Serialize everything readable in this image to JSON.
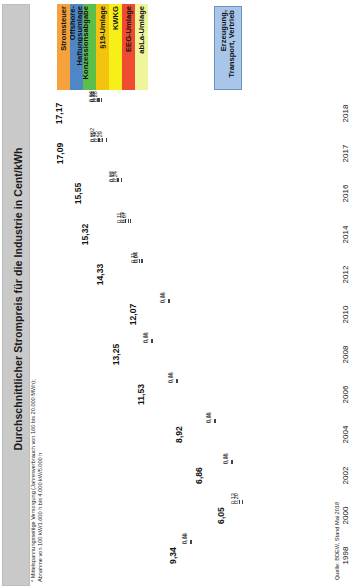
{
  "title": "Durchschnittlicher Strompreis für die Industrie in Cent/kWh",
  "footnote": {
    "line1": "*  Mittelspannungsseitige Versorgung (Jahresverbrauch von 160 bis 20.000 MWh);",
    "line2": "   Abnahme von 100 kW/1.600 h bis 4.000 kW/5.000 h"
  },
  "source": "Quelle: BDEW, Stand Mai 2018",
  "legend": {
    "items": [
      {
        "label": "Stromsteuer",
        "color": "#F6A23C",
        "name": "stromsteuer"
      },
      {
        "label": "Offshore-Haftungsumlage",
        "color": "#4E86C6",
        "name": "offshore-haftungsumlage"
      },
      {
        "label": "Konzessionsabgabe",
        "color": "#5BBF4A",
        "name": "konzessionsabgabe"
      },
      {
        "label": "§19-Umlage",
        "color": "#F2C40F",
        "name": "paragraph19-umlage"
      },
      {
        "label": "KWKG",
        "color": "#F7F018",
        "name": "kwkg"
      },
      {
        "label": "EEG-Umlage",
        "color": "#EE4B32",
        "name": "eeg-umlage"
      },
      {
        "label": "abLa-Umlage",
        "color": "#EFF59A",
        "name": "abla-umlage"
      }
    ],
    "right": {
      "label": "Erzeugung, Transport, Vertrieb",
      "color": "#A8C6EA",
      "name": "erzeugung-transport-vertrieb"
    }
  },
  "chart_data": {
    "type": "bar",
    "orientation": "horizontal-stacked",
    "title": "Durchschnittlicher Strompreis für die Industrie in Cent/kWh",
    "xlabel": "",
    "ylabel": "Cent/kWh",
    "xlim": [
      0,
      18
    ],
    "grid": false,
    "legend_position": "top",
    "categories": [
      "2018",
      "2017",
      "2016",
      "2014",
      "2012",
      "2010",
      "2008",
      "2006",
      "2004",
      "2002",
      "2000",
      "1998"
    ],
    "totals": [
      "17,17",
      "17,09",
      "15,55",
      "15,32",
      "14,33",
      "12,07",
      "13,25",
      "11,53",
      "8,92",
      "6,86",
      "6,05",
      "9,34"
    ],
    "series": [
      {
        "name": "Stromsteuer",
        "color": "#F6A23C",
        "values": [
          1.537,
          1.54,
          1.54,
          1.54,
          1.54,
          1.23,
          1.23,
          1.23,
          1.23,
          1.03,
          0.26,
          0.0
        ]
      },
      {
        "name": "Offshore-Haftungsumlage",
        "color": "#4E86C6",
        "values": [
          0.037,
          0.002,
          0.04,
          0.25,
          0.0,
          0.0,
          0.0,
          0.0,
          0.0,
          0.0,
          0.0,
          0.0
        ]
      },
      {
        "name": "Konzessionsabgabe",
        "color": "#5BBF4A",
        "values": [
          0.04,
          0.11,
          0.03,
          0.11,
          0.11,
          0.11,
          0.11,
          0.11,
          0.11,
          0.11,
          0.13,
          0.11
        ]
      },
      {
        "name": "§19-Umlage",
        "color": "#F2C40F",
        "values": [
          0.11,
          0.25,
          0.38,
          0.23,
          0.1,
          0.0,
          0.0,
          0.0,
          0.0,
          0.0,
          0.0,
          0.0
        ]
      },
      {
        "name": "KWKG",
        "color": "#F7F018",
        "values": [
          0.24,
          0.29,
          0.44,
          0.07,
          0.05,
          0.05,
          0.05,
          0.05,
          0.05,
          0.05,
          0.2,
          0.08
        ]
      },
      {
        "name": "EEG-Umlage",
        "color": "#EE4B32",
        "values": [
          6.792,
          6.88,
          6.354,
          6.24,
          3.59,
          2.05,
          1.16,
          0.88,
          0.51,
          0.35,
          0.0,
          0.0
        ]
      },
      {
        "name": "abLa-Umlage",
        "color": "#EFF59A",
        "values": [
          0.26,
          0.0,
          0.0,
          0.0,
          0.0,
          0.0,
          0.0,
          0.0,
          0.0,
          0.0,
          0.0,
          0.0
        ]
      },
      {
        "name": "Erzeugung, Transport, Vertrieb",
        "color": "#A8C6EA",
        "values": [
          8.18,
          8.02,
          7.0,
          6.95,
          8.98,
          8.63,
          10.7,
          9.26,
          7.02,
          5.99,
          5.46,
          9.15
        ]
      }
    ],
    "rows": [
      {
        "year": "2018",
        "total": "17,17",
        "segments": [
          {
            "name": "Stromsteuer",
            "value": 1.537,
            "label": "1,537",
            "color": "#F6A23C",
            "inside": true
          },
          {
            "name": "Offshore-Haftungsumlage",
            "value": 0.037,
            "label": "",
            "color": "#4E86C6",
            "inside": false
          },
          {
            "name": "Konzessionsabgabe",
            "value": 0.04,
            "label": "",
            "color": "#5BBF4A",
            "inside": false
          },
          {
            "name": "§19-Umlage",
            "value": 0.11,
            "label": "",
            "color": "#F2C40F",
            "inside": false
          },
          {
            "name": "KWKG",
            "value": 0.24,
            "label": "",
            "color": "#F7F018",
            "inside": false
          },
          {
            "name": "abLa-Umlage",
            "value": 0.26,
            "label": "",
            "color": "#EFF59A",
            "inside": false
          },
          {
            "name": "EEG-Umlage",
            "value": 6.792,
            "label": "6,792",
            "color": "#EE4B32",
            "inside": true
          },
          {
            "name": "Erzeugung, Transport, Vertrieb",
            "value": 8.18,
            "label": "8,18",
            "color": "#A8C6EA",
            "inside": true
          }
        ],
        "callouts": [
          "0,04",
          "0,11",
          "0,24",
          "0,26"
        ]
      },
      {
        "year": "2017",
        "total": "17,09",
        "segments": [
          {
            "name": "Stromsteuer",
            "value": 1.54,
            "label": "1,54",
            "color": "#F6A23C",
            "inside": true
          },
          {
            "name": "Offshore-Haftungsumlage",
            "value": 0.002,
            "label": "",
            "color": "#4E86C6",
            "inside": false
          },
          {
            "name": "Konzessionsabgabe",
            "value": 0.11,
            "label": "",
            "color": "#5BBF4A",
            "inside": false
          },
          {
            "name": "§19-Umlage",
            "value": 0.25,
            "label": "",
            "color": "#F2C40F",
            "inside": false
          },
          {
            "name": "KWKG",
            "value": 0.29,
            "label": "",
            "color": "#F7F018",
            "inside": false
          },
          {
            "name": "EEG-Umlage",
            "value": 6.88,
            "label": "6,88",
            "color": "#EE4B32",
            "inside": true
          },
          {
            "name": "Erzeugung, Transport, Vertrieb",
            "value": 8.02,
            "label": "8,02",
            "color": "#A8C6EA",
            "inside": true
          }
        ],
        "callouts": [
          "0,002",
          "0,11",
          "0,25",
          "0,29"
        ]
      },
      {
        "year": "2016",
        "total": "15,55",
        "segments": [
          {
            "name": "Stromsteuer",
            "value": 1.54,
            "label": "1,54",
            "color": "#F6A23C",
            "inside": true
          },
          {
            "name": "Offshore-Haftungsumlage",
            "value": 0.03,
            "label": "0,03",
            "color": "#4E86C6",
            "inside": false
          },
          {
            "name": "Konzessionsabgabe",
            "value": 0.11,
            "label": "",
            "color": "#5BBF4A",
            "inside": false
          },
          {
            "name": "§19-Umlage",
            "value": 0.38,
            "label": "",
            "color": "#F2C40F",
            "inside": false
          },
          {
            "name": "KWKG",
            "value": 0.44,
            "label": "",
            "color": "#F7F018",
            "inside": false
          },
          {
            "name": "EEG-Umlage",
            "value": 6.354,
            "label": "6,354",
            "color": "#EE4B32",
            "inside": true
          },
          {
            "name": "Erzeugung, Transport, Vertrieb",
            "value": 7.0,
            "label": "7,00",
            "color": "#A8C6EA",
            "inside": true
          }
        ],
        "callouts": [
          "0,03",
          "0,11",
          "0,24"
        ]
      },
      {
        "year": "2014",
        "total": "15,32",
        "segments": [
          {
            "name": "Stromsteuer",
            "value": 1.54,
            "label": "1,54",
            "color": "#F6A23C",
            "inside": true
          },
          {
            "name": "Offshore-Haftungsumlage",
            "value": 0.25,
            "label": "0,25",
            "color": "#4E86C6",
            "inside": true
          },
          {
            "name": "Konzessionsabgabe",
            "value": 0.11,
            "label": "",
            "color": "#5BBF4A",
            "inside": false
          },
          {
            "name": "§19-Umlage",
            "value": 0.23,
            "label": "",
            "color": "#F2C40F",
            "inside": false
          },
          {
            "name": "KWKG",
            "value": 0.07,
            "label": "",
            "color": "#F7F018",
            "inside": false
          },
          {
            "name": "EEG-Umlage",
            "value": 6.24,
            "label": "6,24",
            "color": "#EE4B32",
            "inside": true
          },
          {
            "name": "Erzeugung, Transport, Vertrieb",
            "value": 6.95,
            "label": "6,95",
            "color": "#A8C6EA",
            "inside": true
          }
        ],
        "callouts": [
          "0,11",
          "0,23",
          "0,07"
        ]
      },
      {
        "year": "2012",
        "total": "14,33",
        "segments": [
          {
            "name": "Stromsteuer",
            "value": 1.54,
            "label": "1,54",
            "color": "#F6A23C",
            "inside": true
          },
          {
            "name": "Konzessionsabgabe",
            "value": 0.11,
            "label": "",
            "color": "#5BBF4A",
            "inside": false
          },
          {
            "name": "§19-Umlage",
            "value": 0.07,
            "label": "",
            "color": "#F2C40F",
            "inside": false
          },
          {
            "name": "KWKG",
            "value": 0.04,
            "label": "",
            "color": "#F7F018",
            "inside": false
          },
          {
            "name": "EEG-Umlage",
            "value": 3.59,
            "label": "3,59",
            "color": "#EE4B32",
            "inside": true
          },
          {
            "name": "Erzeugung, Transport, Vertrieb",
            "value": 8.98,
            "label": "8,98",
            "color": "#A8C6EA",
            "inside": true
          }
        ],
        "callouts": [
          "0,11",
          "0,07",
          "0,04"
        ]
      },
      {
        "year": "2010",
        "total": "12,07",
        "segments": [
          {
            "name": "Stromsteuer",
            "value": 1.23,
            "label": "1,23",
            "color": "#F6A23C",
            "inside": true
          },
          {
            "name": "Konzessionsabgabe",
            "value": 0.11,
            "label": "",
            "color": "#5BBF4A",
            "inside": false
          },
          {
            "name": "KWKG",
            "value": 0.05,
            "label": "",
            "color": "#F7F018",
            "inside": false
          },
          {
            "name": "EEG-Umlage",
            "value": 2.05,
            "label": "2,05",
            "color": "#EE4B32",
            "inside": true
          },
          {
            "name": "Erzeugung, Transport, Vertrieb",
            "value": 8.63,
            "label": "8,63",
            "color": "#A8C6EA",
            "inside": true
          }
        ],
        "callouts": [
          "0,11",
          "0,05"
        ]
      },
      {
        "year": "2008",
        "total": "13,25",
        "segments": [
          {
            "name": "Stromsteuer",
            "value": 1.23,
            "label": "1,23",
            "color": "#F6A23C",
            "inside": true
          },
          {
            "name": "Konzessionsabgabe",
            "value": 0.11,
            "label": "",
            "color": "#5BBF4A",
            "inside": false
          },
          {
            "name": "KWKG",
            "value": 0.05,
            "label": "",
            "color": "#F7F018",
            "inside": false
          },
          {
            "name": "EEG-Umlage",
            "value": 1.16,
            "label": "1,16",
            "color": "#EE4B32",
            "inside": true
          },
          {
            "name": "Erzeugung, Transport, Vertrieb",
            "value": 10.7,
            "label": "10,70",
            "color": "#A8C6EA",
            "inside": true
          }
        ],
        "callouts": [
          "0,11",
          "0,05"
        ]
      },
      {
        "year": "2006",
        "total": "11,53",
        "segments": [
          {
            "name": "Stromsteuer",
            "value": 1.23,
            "label": "1,23",
            "color": "#F6A23C",
            "inside": true
          },
          {
            "name": "Konzessionsabgabe",
            "value": 0.11,
            "label": "",
            "color": "#5BBF4A",
            "inside": false
          },
          {
            "name": "KWKG",
            "value": 0.05,
            "label": "",
            "color": "#F7F018",
            "inside": false
          },
          {
            "name": "EEG-Umlage",
            "value": 0.88,
            "label": "0,88",
            "color": "#EE4B32",
            "inside": true
          },
          {
            "name": "Erzeugung, Transport, Vertrieb",
            "value": 9.26,
            "label": "9,26",
            "color": "#A8C6EA",
            "inside": true
          }
        ],
        "callouts": [
          "0,11",
          "0,05"
        ]
      },
      {
        "year": "2004",
        "total": "8,92",
        "segments": [
          {
            "name": "Stromsteuer",
            "value": 1.23,
            "label": "1,23",
            "color": "#F6A23C",
            "inside": true
          },
          {
            "name": "Konzessionsabgabe",
            "value": 0.11,
            "label": "",
            "color": "#5BBF4A",
            "inside": false
          },
          {
            "name": "KWKG",
            "value": 0.05,
            "label": "",
            "color": "#F7F018",
            "inside": false
          },
          {
            "name": "EEG-Umlage",
            "value": 0.51,
            "label": "0,51",
            "color": "#EE4B32",
            "inside": true
          },
          {
            "name": "Erzeugung, Transport, Vertrieb",
            "value": 7.02,
            "label": "7,02",
            "color": "#A8C6EA",
            "inside": true
          }
        ],
        "callouts": [
          "0,11",
          "0,05"
        ]
      },
      {
        "year": "2002",
        "total": "6,86",
        "segments": [
          {
            "name": "Stromsteuer",
            "value": 1.03,
            "label": "1,03",
            "color": "#F6A23C",
            "inside": true
          },
          {
            "name": "Konzessionsabgabe",
            "value": 0.11,
            "label": "",
            "color": "#5BBF4A",
            "inside": false
          },
          {
            "name": "KWKG",
            "value": 0.05,
            "label": "",
            "color": "#F7F018",
            "inside": false
          },
          {
            "name": "EEG-Umlage",
            "value": 0.35,
            "label": "0,35",
            "color": "#EE4B32",
            "inside": true
          },
          {
            "name": "Erzeugung, Transport, Vertrieb",
            "value": 5.99,
            "label": "5,99",
            "color": "#A8C6EA",
            "inside": true
          }
        ],
        "callouts": [
          "0,11",
          "0,05"
        ]
      },
      {
        "year": "2000",
        "total": "6,05",
        "segments": [
          {
            "name": "Stromsteuer",
            "value": 0.26,
            "label": "0,26",
            "color": "#F6A23C",
            "inside": true
          },
          {
            "name": "Konzessionsabgabe",
            "value": 0.13,
            "label": "",
            "color": "#5BBF4A",
            "inside": false
          },
          {
            "name": "KWKG",
            "value": 0.2,
            "label": "0,20",
            "color": "#F7F018",
            "inside": false
          },
          {
            "name": "Erzeugung, Transport, Vertrieb",
            "value": 5.46,
            "label": "5,46",
            "color": "#A8C6EA",
            "inside": true
          }
        ],
        "callouts": [
          "0,13",
          "0,20"
        ]
      },
      {
        "year": "1998",
        "total": "9,34",
        "segments": [
          {
            "name": "Konzessionsabgabe",
            "value": 0.11,
            "label": "",
            "color": "#5BBF4A",
            "inside": false
          },
          {
            "name": "KWKG",
            "value": 0.08,
            "label": "",
            "color": "#F7F018",
            "inside": false
          },
          {
            "name": "Erzeugung, Transport, Vertrieb",
            "value": 9.15,
            "label": "9,15",
            "color": "#A8C6EA",
            "inside": true
          }
        ],
        "callouts": [
          "0,11",
          "0,08"
        ]
      }
    ]
  }
}
